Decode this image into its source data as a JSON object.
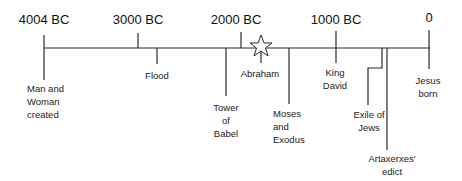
{
  "diagram": {
    "type": "timeline",
    "title": "",
    "eras": [
      {
        "label": "4004 BC",
        "x": 44
      },
      {
        "label": "3000 BC",
        "x": 138
      },
      {
        "label": "2000 BC",
        "x": 235
      },
      {
        "label": "1000 BC",
        "x": 336
      },
      {
        "label": "0",
        "x": 429
      }
    ],
    "events": [
      {
        "id": "creation",
        "label": "Man and\nWoman\ncreated"
      },
      {
        "id": "flood",
        "label": "Flood"
      },
      {
        "id": "babel",
        "label": "Tower\nof\nBabel"
      },
      {
        "id": "abraham",
        "label": "Abraham",
        "marker": "star"
      },
      {
        "id": "moses",
        "label": "Moses\nand\nExodus"
      },
      {
        "id": "david",
        "label": "King\nDavid"
      },
      {
        "id": "exile",
        "label": "Exile of\nJews"
      },
      {
        "id": "artaxerxes",
        "label": "Artaxerxes'\nedict"
      },
      {
        "id": "jesus",
        "label": "Jesus\nborn"
      }
    ],
    "colors": {
      "line": "#2a2a2a",
      "text": "#222222",
      "background": "#ffffff"
    }
  }
}
